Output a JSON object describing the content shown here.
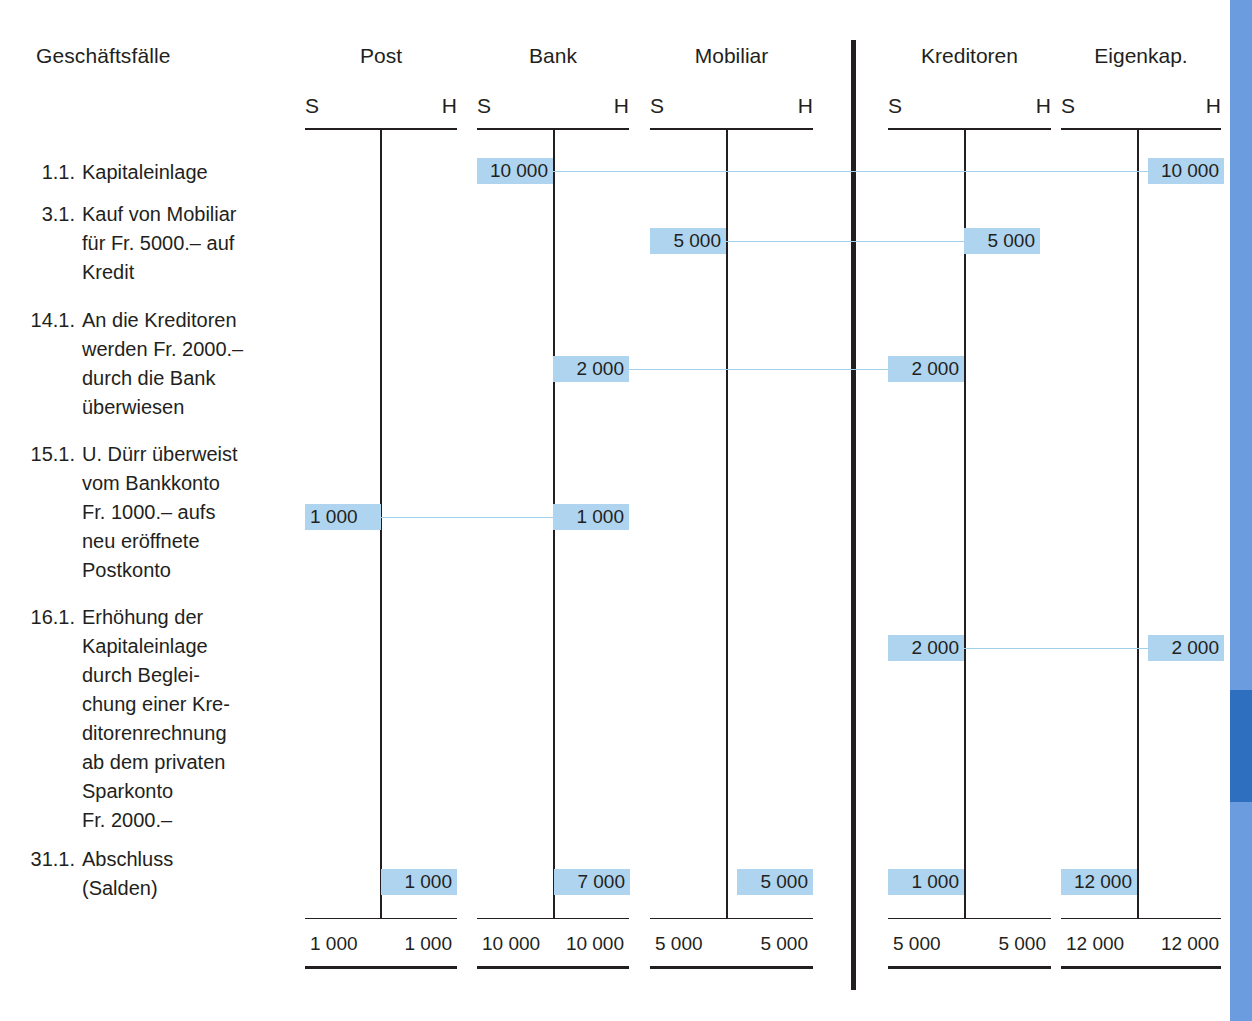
{
  "header": {
    "description_column_label": "Geschäftsfälle",
    "debit_label": "S",
    "credit_label": "H"
  },
  "accounts": [
    {
      "key": "post",
      "name": "Post"
    },
    {
      "key": "bank",
      "name": "Bank"
    },
    {
      "key": "mobiliar",
      "name": "Mobiliar"
    },
    {
      "key": "kreditoren",
      "name": "Kreditoren"
    },
    {
      "key": "eigenkapital",
      "name": "Eigenkap."
    }
  ],
  "entries": [
    {
      "date": "1.1.",
      "description": "Kapitaleinlage"
    },
    {
      "date": "3.1.",
      "description": "Kauf von Mobiliar\nfür Fr. 5000.– auf\nKredit"
    },
    {
      "date": "14.1.",
      "description": "An die Kreditoren\nwerden Fr. 2000.–\ndurch die Bank\nüberwiesen"
    },
    {
      "date": "15.1.",
      "description": "U. Dürr überweist\nvom Bankkonto\nFr. 1000.– aufs\nneu eröffnete\nPostkonto"
    },
    {
      "date": "16.1.",
      "description": "Erhöhung der\nKapitaleinlage\ndurch Beglei-\nchung einer Kre-\nditorenrechnung\nab dem privaten\nSparkonto\nFr. 2000.–"
    },
    {
      "date": "31.1.",
      "description": "Abschluss\n(Salden)"
    }
  ],
  "postings": [
    {
      "entry": "1.1.",
      "amounts": {
        "bank_s": "10 000",
        "eigenkapital_h": "10 000"
      }
    },
    {
      "entry": "3.1.",
      "amounts": {
        "mobiliar_s": "5 000",
        "kreditoren_h": "5 000"
      }
    },
    {
      "entry": "14.1.",
      "amounts": {
        "bank_h": "2 000",
        "kreditoren_s": "2 000"
      }
    },
    {
      "entry": "15.1.",
      "amounts": {
        "post_s": "1 000",
        "bank_h": "1 000"
      }
    },
    {
      "entry": "16.1.",
      "amounts": {
        "kreditoren_s": "2 000",
        "eigenkapital_h": "2 000"
      }
    },
    {
      "entry": "31.1.",
      "amounts": {
        "post_h": "1 000",
        "bank_h": "7 000",
        "mobiliar_h": "5 000",
        "kreditoren_s": "1 000",
        "eigenkapital_s": "12 000"
      }
    }
  ],
  "cells": {
    "r1_bank_s": "10 000",
    "r1_eigenkapital_h": "10 000",
    "r2_mobiliar_s": "5 000",
    "r2_kreditoren_h": "5 000",
    "r3_bank_h": "2 000",
    "r3_kreditoren_s": "2 000",
    "r4_post_s": "1 000",
    "r4_bank_h": "1 000",
    "r5_kreditoren_s": "2 000",
    "r5_eigenkapital_h": "2 000",
    "r6_post_h": "1 000",
    "r6_bank_h": "7 000",
    "r6_mobiliar_h": "5 000",
    "r6_kreditoren_s": "1 000",
    "r6_eigenkapital_s": "12 000"
  },
  "totals": {
    "post_s": "1 000",
    "post_h": "1 000",
    "bank_s": "10 000",
    "bank_h": "10 000",
    "mobiliar_s": "5 000",
    "mobiliar_h": "5 000",
    "kreditoren_s": "5 000",
    "kreditoren_h": "5 000",
    "eigenkapital_s": "12 000",
    "eigenkapital_h": "12 000"
  },
  "colors": {
    "highlight": "#aed4f0",
    "connector": "#9fd2ea",
    "rule": "#231f20",
    "edge_bar": "#6b9ce0",
    "edge_bar_dark": "#2f6fc0"
  }
}
